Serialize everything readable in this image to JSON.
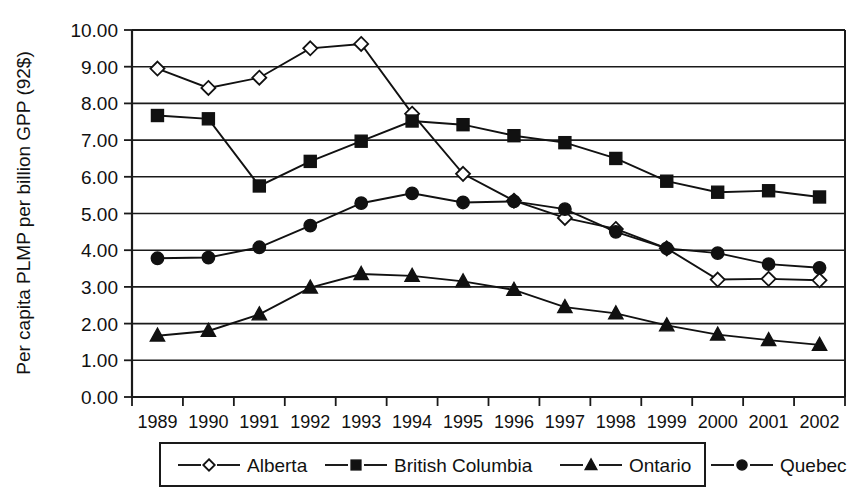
{
  "chart_data": {
    "type": "line",
    "title": "",
    "xlabel": "",
    "ylabel": "Per capita PLMP per billion GPP (92$)",
    "categories": [
      "1989",
      "1990",
      "1991",
      "1992",
      "1993",
      "1994",
      "1995",
      "1996",
      "1997",
      "1998",
      "1999",
      "2000",
      "2001",
      "2002"
    ],
    "x": [
      1989,
      1990,
      1991,
      1992,
      1993,
      1994,
      1995,
      1996,
      1997,
      1998,
      1999,
      2000,
      2001,
      2002
    ],
    "ylim": [
      0.0,
      10.0
    ],
    "ytick_labels": [
      "0.00",
      "1.00",
      "2.00",
      "3.00",
      "4.00",
      "5.00",
      "6.00",
      "7.00",
      "8.00",
      "9.00",
      "10.00"
    ],
    "ytick_values": [
      0,
      1,
      2,
      3,
      4,
      5,
      6,
      7,
      8,
      9,
      10
    ],
    "grid": true,
    "grid_axis": "y",
    "legend_position": "bottom",
    "series": [
      {
        "name": "Alberta",
        "marker": "open-diamond",
        "values": [
          8.95,
          8.42,
          8.7,
          9.5,
          9.62,
          7.72,
          6.08,
          5.35,
          4.88,
          4.58,
          4.05,
          3.2,
          3.22,
          3.18
        ]
      },
      {
        "name": "British Columbia",
        "marker": "filled-square",
        "values": [
          7.67,
          7.58,
          5.75,
          6.42,
          6.97,
          7.52,
          7.42,
          7.12,
          6.93,
          6.5,
          5.88,
          5.58,
          5.62,
          5.45
        ]
      },
      {
        "name": "Ontario",
        "marker": "filled-triangle",
        "values": [
          1.67,
          1.8,
          2.25,
          2.98,
          3.35,
          3.3,
          3.15,
          2.92,
          2.45,
          2.28,
          1.95,
          1.7,
          1.55,
          1.42
        ]
      },
      {
        "name": "Quebec",
        "marker": "filled-circle",
        "values": [
          3.78,
          3.8,
          4.08,
          4.67,
          5.28,
          5.55,
          5.3,
          5.33,
          5.12,
          4.5,
          4.05,
          3.92,
          3.62,
          3.52
        ]
      }
    ]
  },
  "legend": {
    "items": [
      {
        "label": "Alberta",
        "marker": "open-diamond"
      },
      {
        "label": "British Columbia",
        "marker": "filled-square"
      },
      {
        "label": "Ontario",
        "marker": "filled-triangle"
      },
      {
        "label": "Quebec",
        "marker": "filled-circle"
      }
    ]
  },
  "colors": {
    "ink": "#111111",
    "background": "#ffffff"
  }
}
